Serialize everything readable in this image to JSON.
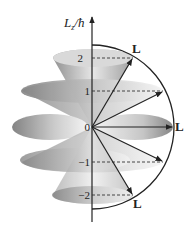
{
  "diagram": {
    "axis": {
      "label_main": "L",
      "label_sub": "z",
      "label_tail": "/ħ"
    },
    "levels": [
      {
        "m": 2,
        "label": "2"
      },
      {
        "m": 1,
        "label": "1"
      },
      {
        "m": 0,
        "label": "0"
      },
      {
        "m": -1,
        "label": "−1"
      },
      {
        "m": -2,
        "label": "−2"
      }
    ],
    "vector_label": "L",
    "vector_labels_shown_at": [
      2,
      0,
      -2
    ]
  },
  "colors": {
    "ink": "#222222",
    "cone_dark": "#8a8a8a",
    "cone_light": "#f2f2f2"
  }
}
